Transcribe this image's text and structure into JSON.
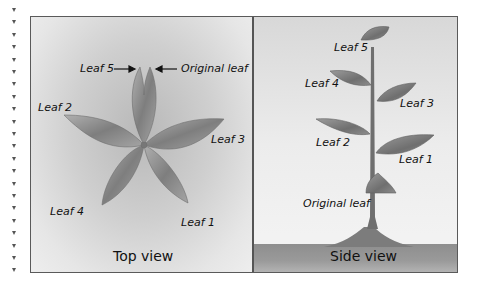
{
  "left_margin": {
    "marker_count": 22
  },
  "top_view": {
    "title": "Top view",
    "labels": {
      "leaf5": "Leaf 5",
      "original": "Original leaf",
      "leaf2": "Leaf 2",
      "leaf3": "Leaf 3",
      "leaf4": "Leaf 4",
      "leaf1": "Leaf 1"
    }
  },
  "side_view": {
    "title": "Side view",
    "labels": {
      "leaf5": "Leaf 5",
      "leaf4": "Leaf 4",
      "leaf3": "Leaf 3",
      "leaf2": "Leaf 2",
      "leaf1": "Leaf 1",
      "original": "Original leaf"
    }
  },
  "colors": {
    "frame": "#5a5a5a",
    "leaf": "#8a8a8a",
    "ground": "#959595"
  }
}
